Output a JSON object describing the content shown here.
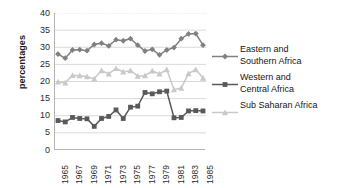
{
  "chart_data": {
    "type": "line",
    "title": "",
    "xlabel": "",
    "ylabel": "percentages",
    "ylim": [
      0,
      40
    ],
    "ytick_step": 5,
    "grid": true,
    "grid_axis": "y",
    "legend_position": "right",
    "x": [
      1965,
      1966,
      1967,
      1968,
      1969,
      1970,
      1971,
      1972,
      1973,
      1974,
      1975,
      1976,
      1977,
      1978,
      1979,
      1980,
      1981,
      1982,
      1983,
      1984,
      1985
    ],
    "xticklabels": [
      "1965",
      "1967",
      "1969",
      "1971",
      "1973",
      "1975",
      "1977",
      "1979",
      "1981",
      "1983",
      "1985"
    ],
    "yticklabels": [
      "0",
      "5",
      "10",
      "15",
      "20",
      "25",
      "30",
      "35",
      "40"
    ],
    "series": [
      {
        "name": "Eastern and Southern Africa",
        "marker": "diamond",
        "color": "#808080",
        "values": [
          28.0,
          26.8,
          29.2,
          29.3,
          29.0,
          30.8,
          31.2,
          30.4,
          32.2,
          31.9,
          32.5,
          30.6,
          28.9,
          29.4,
          27.8,
          29.2,
          29.9,
          32.5,
          33.9,
          34.0,
          30.6
        ]
      },
      {
        "name": "Western and Central Africa",
        "marker": "square",
        "color": "#595959",
        "values": [
          8.6,
          8.2,
          9.5,
          9.2,
          9.1,
          6.9,
          9.2,
          9.8,
          11.7,
          9.2,
          12.5,
          12.8,
          16.8,
          16.4,
          17.0,
          17.2,
          9.4,
          9.5,
          11.4,
          11.5,
          11.4
        ]
      },
      {
        "name": "Sub Saharan Africa",
        "marker": "triangle",
        "color": "#c9c9c9",
        "values": [
          19.9,
          19.6,
          21.8,
          21.7,
          21.4,
          20.8,
          23.2,
          22.2,
          23.8,
          22.8,
          23.2,
          21.6,
          21.7,
          23.1,
          22.2,
          23.5,
          17.6,
          18.1,
          22.3,
          23.5,
          21.0
        ]
      }
    ]
  },
  "axis": {
    "y_title": "percentages"
  },
  "legend": {
    "items": [
      {
        "label": "Eastern and\nSouthern Africa",
        "marker": "diamond",
        "color": "#808080"
      },
      {
        "label": "Western and\nCentral Africa",
        "marker": "square",
        "color": "#595959"
      },
      {
        "label": "Sub Saharan Africa",
        "marker": "triangle",
        "color": "#c9c9c9"
      }
    ]
  }
}
